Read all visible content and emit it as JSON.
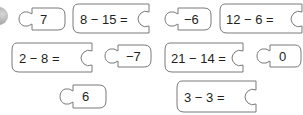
{
  "colors": {
    "outline": "#7a7a7a",
    "fill": "#ffffff",
    "text": "#231f20"
  },
  "questions": [
    {
      "id": "q1",
      "label": "8 − 15 ="
    },
    {
      "id": "q2",
      "label": "12 − 6 ="
    },
    {
      "id": "q3",
      "label": "2 − 8 ="
    },
    {
      "id": "q4",
      "label": "21 − 14 ="
    },
    {
      "id": "q5",
      "label": "3 − 3 ="
    }
  ],
  "answers": [
    {
      "id": "a1",
      "label": "7"
    },
    {
      "id": "a2",
      "label": "−6"
    },
    {
      "id": "a3",
      "label": "−7"
    },
    {
      "id": "a4",
      "label": "0"
    },
    {
      "id": "a5",
      "label": "6"
    }
  ]
}
